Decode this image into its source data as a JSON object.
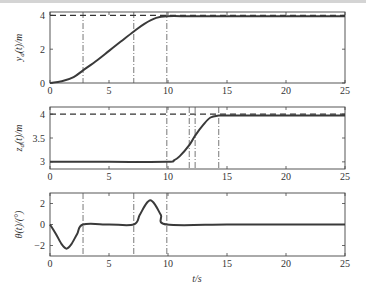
{
  "chart_data": [
    {
      "type": "line",
      "title": "",
      "xlabel": "",
      "ylabel": "y_d(t)/m",
      "xlim": [
        0,
        25
      ],
      "ylim": [
        0,
        4.2
      ],
      "xticks": [
        0,
        5,
        10,
        15,
        20,
        25
      ],
      "yticks": [
        0,
        2,
        4
      ],
      "grid": false,
      "series": [
        {
          "name": "y_d(t)",
          "style": "solid",
          "x": [
            0,
            1,
            2,
            2.8,
            4,
            5,
            6,
            7.1,
            8,
            9,
            9.9,
            12,
            15,
            20,
            25
          ],
          "y": [
            0,
            0.1,
            0.35,
            0.75,
            1.35,
            1.9,
            2.45,
            3.05,
            3.5,
            3.85,
            3.95,
            3.95,
            3.95,
            3.95,
            3.95
          ]
        },
        {
          "name": "reference",
          "style": "dashed",
          "x": [
            0,
            25
          ],
          "y": [
            4,
            4
          ]
        }
      ],
      "vlines": [
        2.8,
        7.1,
        9.9
      ]
    },
    {
      "type": "line",
      "title": "",
      "xlabel": "",
      "ylabel": "z_d(t)/m",
      "xlim": [
        0,
        25
      ],
      "ylim": [
        2.85,
        4.15
      ],
      "xticks": [
        0,
        5,
        10,
        15,
        20,
        25
      ],
      "yticks": [
        3,
        3.5,
        4
      ],
      "grid": false,
      "series": [
        {
          "name": "z_d(t)",
          "style": "solid",
          "x": [
            0,
            5,
            9.9,
            10.5,
            11,
            11.8,
            12.3,
            13,
            13.6,
            14.3,
            15,
            20,
            25
          ],
          "y": [
            3,
            3,
            3,
            3.03,
            3.12,
            3.35,
            3.55,
            3.78,
            3.93,
            3.97,
            3.97,
            3.97,
            3.97
          ]
        },
        {
          "name": "reference",
          "style": "dashed",
          "x": [
            0,
            25
          ],
          "y": [
            4,
            4
          ]
        }
      ],
      "vlines": [
        9.9,
        11.8,
        12.3,
        14.3
      ]
    },
    {
      "type": "line",
      "title": "",
      "xlabel": "t/s",
      "ylabel": "θ(t)/(°)",
      "xlim": [
        0,
        25
      ],
      "ylim": [
        -3,
        3
      ],
      "xticks": [
        0,
        5,
        10,
        15,
        20,
        25
      ],
      "yticks": [
        -2,
        0,
        2
      ],
      "grid": false,
      "series": [
        {
          "name": "θ(t)",
          "style": "solid",
          "x": [
            0,
            0.5,
            1,
            1.4,
            1.8,
            2.3,
            2.8,
            5,
            7.1,
            7.6,
            8.1,
            8.5,
            8.9,
            9.4,
            9.9,
            15,
            20,
            25
          ],
          "y": [
            0,
            -0.9,
            -1.9,
            -2.3,
            -1.9,
            -0.9,
            0,
            0,
            0,
            0.9,
            1.9,
            2.3,
            1.9,
            0.9,
            0,
            0,
            0,
            0
          ]
        }
      ],
      "vlines": [
        2.8,
        7.1,
        9.9
      ]
    }
  ],
  "labels": {
    "panel1_ylabel": "y",
    "panel1_ylabel_sub": "d",
    "panel1_ylabel_rest": "(t)/m",
    "panel2_ylabel": "z",
    "panel2_ylabel_sub": "d",
    "panel2_ylabel_rest": "(t)/m",
    "panel3_ylabel": "θ(t)/(°)",
    "xlabel": "t/s",
    "xticks": [
      "0",
      "5",
      "10",
      "15",
      "20",
      "25"
    ],
    "p1_yticks": [
      "0",
      "2",
      "4"
    ],
    "p2_yticks": [
      "3",
      "3.5",
      "4"
    ],
    "p3_yticks": [
      "−2",
      "0",
      "2"
    ]
  }
}
